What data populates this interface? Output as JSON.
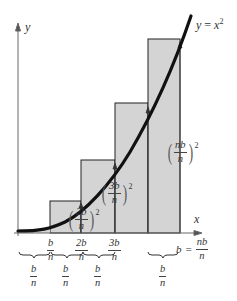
{
  "figure": {
    "type": "Riemann sum (right endpoints) under y = x^2",
    "curve_label": {
      "lhs": "y",
      "eq": "=",
      "rhs": "x",
      "exp": "2"
    },
    "axis_labels": {
      "x": "x",
      "y": "y"
    },
    "tick_labels": [
      {
        "num": "b",
        "den": "n"
      },
      {
        "num": "2b",
        "den": "n"
      },
      {
        "num": "3b",
        "den": "n"
      }
    ],
    "endpoint_label": {
      "lhs": "b",
      "eq": "=",
      "num": "nb",
      "den": "n"
    },
    "height_labels": [
      {
        "num": "2b",
        "den": "n",
        "exp": "2"
      },
      {
        "num": "3b",
        "den": "n",
        "exp": "2"
      },
      {
        "num": "nb",
        "den": "n",
        "exp": "2"
      }
    ],
    "width_labels": [
      {
        "num": "b",
        "den": "n"
      },
      {
        "num": "b",
        "den": "n"
      },
      {
        "num": "b",
        "den": "n"
      },
      {
        "num": "b",
        "den": "n"
      }
    ],
    "colors": {
      "rect_fill": "#d4d4d4",
      "rect_stroke": "#222222",
      "curve": "#111111",
      "axis": "#555555"
    }
  }
}
